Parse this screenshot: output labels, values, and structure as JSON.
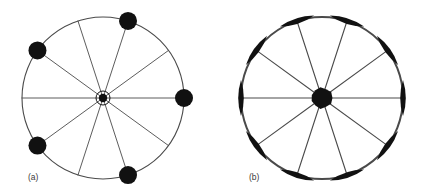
{
  "figure": {
    "background_color": "#ffffff",
    "ink_color": "#111111",
    "rim_color": "#4a4a4a",
    "panels": [
      {
        "id": "panel-a",
        "label": "(a)",
        "label_x": 28,
        "label_y": 180,
        "center_x": 103,
        "center_y": 98,
        "radius": 81,
        "rim_stroke_width": 1.1,
        "spoke_stroke_width": 0.9,
        "spoke_count": 10,
        "spoke_angles_deg": [
          0,
          36,
          72,
          108,
          144,
          180,
          216,
          252,
          288,
          324
        ],
        "hub": {
          "type": "ringed-dot",
          "core_radius": 4.2,
          "ring_radius": 7.0,
          "ring_stroke_width": 1.0
        },
        "rim_markers": {
          "type": "disc",
          "radius": 9.0,
          "angles_deg": [
            0,
            72,
            144,
            216,
            288
          ]
        }
      },
      {
        "id": "panel-b",
        "label": "(b)",
        "label_x": 249,
        "label_y": 180,
        "center_x": 322,
        "center_y": 98,
        "radius": 81,
        "rim_stroke_width": 2.0,
        "spoke_stroke_width": 1.1,
        "spoke_count": 10,
        "spoke_angles_deg": [
          0,
          36,
          72,
          108,
          144,
          180,
          216,
          252,
          288,
          324
        ],
        "hub": {
          "type": "solid-blob",
          "core_radius": 11.0
        },
        "rim_markers": {
          "type": "lens",
          "half_length": 18.0,
          "half_width": 5.6,
          "angles_deg": [
            0,
            36,
            72,
            108,
            144,
            180,
            216,
            252,
            288,
            324
          ]
        }
      }
    ]
  },
  "caption": {
    "panel_a_label": "(a)",
    "panel_b_label": "(b)"
  }
}
